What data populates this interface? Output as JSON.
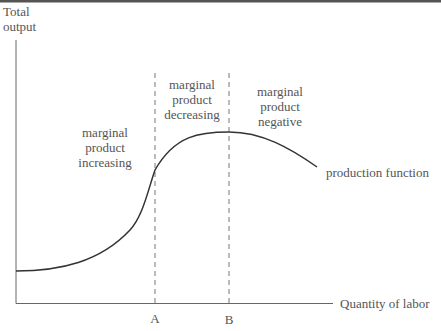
{
  "diagram": {
    "y_axis_label_line1": "Total",
    "y_axis_label_line2": "output",
    "x_axis_label": "Quantity of labor",
    "tick_a": "A",
    "tick_b": "B",
    "curve_label": "production function",
    "regions": [
      {
        "line1": "marginal",
        "line2": "product",
        "line3": "increasing"
      },
      {
        "line1": "marginal",
        "line2": "product",
        "line3": "decreasing"
      },
      {
        "line1": "marginal",
        "line2": "product",
        "line3": "negative"
      }
    ],
    "colors": {
      "axis": "#666666",
      "curve": "#333333",
      "dashed": "#777777",
      "top_rule": "#555555"
    }
  }
}
